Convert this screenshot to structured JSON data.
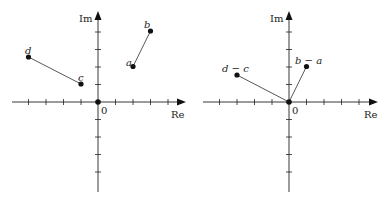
{
  "diagram": {
    "type": "complex-plane",
    "panels": [
      {
        "id": "left",
        "axes": {
          "x_label": "Re",
          "y_label": "Im",
          "origin_label": "0",
          "tick_range_x": [
            -4,
            4
          ],
          "tick_range_y": [
            -4,
            4
          ]
        },
        "points": [
          {
            "label": "a",
            "re": 2,
            "im": 2
          },
          {
            "label": "b",
            "re": 3,
            "im": 4
          },
          {
            "label": "c",
            "re": -1,
            "im": 1
          },
          {
            "label": "d",
            "re": -4,
            "im": 2.5
          },
          {
            "label": "",
            "re": 0,
            "im": 0
          }
        ],
        "segments": [
          [
            "a",
            "b"
          ],
          [
            "c",
            "d"
          ]
        ]
      },
      {
        "id": "right",
        "axes": {
          "x_label": "Re",
          "y_label": "Im",
          "origin_label": "0",
          "tick_range_x": [
            -4,
            4
          ],
          "tick_range_y": [
            -4,
            4
          ]
        },
        "points": [
          {
            "label": "b − a",
            "re": 1,
            "im": 2
          },
          {
            "label": "d − c",
            "re": -3,
            "im": 1.5
          },
          {
            "label": "",
            "re": 0,
            "im": 0
          }
        ],
        "segments": [
          [
            "0",
            "b − a"
          ],
          [
            "0",
            "d − c"
          ]
        ]
      }
    ]
  },
  "labels": {
    "left": {
      "re": "Re",
      "im": "Im",
      "origin": "0",
      "a": "a",
      "b": "b",
      "c": "c",
      "d": "d"
    },
    "right": {
      "re": "Re",
      "im": "Im",
      "origin": "0",
      "ba": "b − a",
      "dc": "d − c"
    }
  }
}
